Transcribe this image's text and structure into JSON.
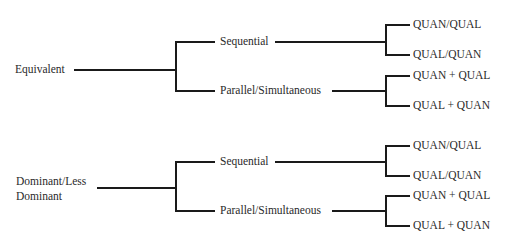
{
  "diagram": {
    "groups": [
      {
        "root": "Equivalent",
        "branches": [
          {
            "label": "Sequential",
            "leaves": [
              "QUAN/QUAL",
              "QUAL/QUAN"
            ]
          },
          {
            "label": "Parallel/Simultaneous",
            "leaves": [
              "QUAN + QUAL",
              "QUAL + QUAN"
            ]
          }
        ]
      },
      {
        "root": "Dominant/Less Dominant",
        "root_lines": [
          "Dominant/Less",
          "Dominant"
        ],
        "branches": [
          {
            "label": "Sequential",
            "leaves": [
              "QUAN/QUAL",
              "QUAL/QUAN"
            ]
          },
          {
            "label": "Parallel/Simultaneous",
            "leaves": [
              "QUAN + QUAL",
              "QUAL + QUAN"
            ]
          }
        ]
      }
    ],
    "line_color": "#1a1a1a"
  }
}
